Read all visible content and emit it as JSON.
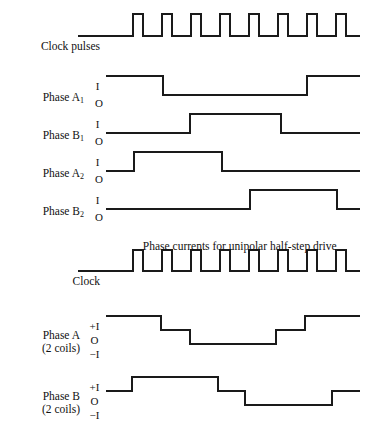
{
  "figure": {
    "width": 382,
    "height": 430,
    "background": "#ffffff",
    "line_color": "#1a1a1a",
    "caption": "Phase currents for unipolar half-step drive"
  },
  "chart_data": {
    "type": "line",
    "title": "Phase currents for unipolar half-step drive",
    "xlabel": "",
    "ylabel": "",
    "grid": false,
    "legend": "none",
    "x_range": [
      106,
      360
    ],
    "traces": [
      {
        "name": "Clock pulses",
        "label": "Clock pulses",
        "kind": "pulse-train",
        "levels": [
          "low",
          "high"
        ],
        "baseline_y": 36,
        "high_y": 14,
        "x_start": 106,
        "x_end": 360,
        "pulse_count": 8,
        "first_rise_x": 133,
        "pulse_width": 10,
        "pulse_period": 29
      },
      {
        "name": "Phase A1",
        "label": "Phase A",
        "subscript": "1",
        "kind": "binary",
        "level_labels": [
          "I",
          "O"
        ],
        "high_y": 76,
        "low_y": 95,
        "x_start": 106,
        "x_end": 360,
        "start_level": "I",
        "transitions": [
          {
            "x": 163,
            "to": "O"
          },
          {
            "x": 307,
            "to": "I"
          }
        ]
      },
      {
        "name": "Phase B1",
        "label": "Phase B",
        "subscript": "1",
        "kind": "binary",
        "level_labels": [
          "I",
          "O"
        ],
        "high_y": 114,
        "low_y": 133,
        "x_start": 106,
        "x_end": 360,
        "start_level": "O",
        "transitions": [
          {
            "x": 190,
            "to": "I"
          },
          {
            "x": 281,
            "to": "O"
          }
        ]
      },
      {
        "name": "Phase A2",
        "label": "Phase A",
        "subscript": "2",
        "kind": "binary",
        "level_labels": [
          "I",
          "O"
        ],
        "high_y": 152,
        "low_y": 171,
        "x_start": 106,
        "x_end": 360,
        "start_level": "O",
        "transitions": [
          {
            "x": 134,
            "to": "I"
          },
          {
            "x": 222,
            "to": "O"
          }
        ]
      },
      {
        "name": "Phase B2",
        "label": "Phase B",
        "subscript": "2",
        "kind": "binary",
        "level_labels": [
          "I",
          "O"
        ],
        "high_y": 190,
        "low_y": 209,
        "x_start": 106,
        "x_end": 360,
        "start_level": "O",
        "transitions": [
          {
            "x": 250,
            "to": "I"
          },
          {
            "x": 337,
            "to": "O"
          }
        ]
      },
      {
        "name": "Clock 2",
        "label": "Clock",
        "kind": "pulse-train",
        "levels": [
          "low",
          "high"
        ],
        "baseline_y": 271,
        "high_y": 250,
        "x_start": 106,
        "x_end": 360,
        "pulse_count": 8,
        "first_rise_x": 133,
        "pulse_width": 10,
        "pulse_period": 29
      },
      {
        "name": "Phase A 2 coils",
        "label": "Phase A",
        "sublabel": "(2 coils)",
        "kind": "tristate",
        "level_labels": [
          "+I",
          "O",
          "−I"
        ],
        "plus_y": 316,
        "zero_y": 330,
        "minus_y": 344,
        "x_start": 106,
        "x_end": 360,
        "start_level": "+I",
        "transitions": [
          {
            "x": 161,
            "to": "O"
          },
          {
            "x": 190,
            "to": "-I"
          },
          {
            "x": 276,
            "to": "O"
          },
          {
            "x": 305,
            "to": "+I"
          }
        ]
      },
      {
        "name": "Phase B 2 coils",
        "label": "Phase B",
        "sublabel": "(2 coils)",
        "kind": "tristate",
        "level_labels": [
          "+I",
          "O",
          "−I"
        ],
        "plus_y": 377,
        "zero_y": 391,
        "minus_y": 405,
        "x_start": 106,
        "x_end": 360,
        "start_level": "O",
        "transitions": [
          {
            "x": 132,
            "to": "+I"
          },
          {
            "x": 218,
            "to": "O"
          },
          {
            "x": 245,
            "to": "-I"
          },
          {
            "x": 332,
            "to": "O"
          }
        ]
      }
    ]
  },
  "labels": {
    "clock_pulses": "Clock pulses",
    "phase_a1": "Phase A",
    "phase_a1_sub": "1",
    "phase_b1": "Phase B",
    "phase_b1_sub": "1",
    "phase_a2": "Phase A",
    "phase_a2_sub": "2",
    "phase_b2": "Phase B",
    "phase_b2_sub": "2",
    "clock": "Clock",
    "phase_a_coils": "Phase A",
    "phase_a_coils_sub": "(2 coils)",
    "phase_b_coils": "Phase B",
    "phase_b_coils_sub": "(2 coils)",
    "level_i": "I",
    "level_o": "O",
    "level_plus_i": "+I",
    "level_minus_i": "−I",
    "caption": "Phase currents for unipolar half-step drive"
  }
}
